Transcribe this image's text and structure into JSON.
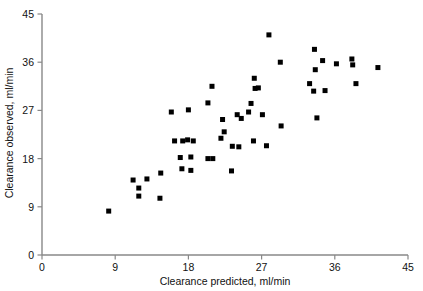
{
  "chart_data": {
    "type": "scatter",
    "title": "",
    "xlabel": "Clearance predicted, ml/min",
    "ylabel": "Clearance observed, ml/min",
    "xlim": [
      0,
      45
    ],
    "ylim": [
      0,
      45
    ],
    "xticks": [
      0,
      9,
      18,
      27,
      36,
      45
    ],
    "yticks": [
      0,
      9,
      18,
      27,
      36,
      45
    ],
    "xticklabels": [
      "0",
      "9",
      "18",
      "27",
      "36",
      "45"
    ],
    "yticklabels": [
      "0",
      "9",
      "18",
      "27",
      "36",
      "45"
    ],
    "grid": false,
    "legend": null,
    "marker": "square",
    "marker_color": "#000000",
    "marker_size_px": 5,
    "axis_color": "#888888",
    "series": [
      {
        "name": "patients",
        "points": [
          [
            8.2,
            8.2
          ],
          [
            11.2,
            14.0
          ],
          [
            11.9,
            12.5
          ],
          [
            12.9,
            14.2
          ],
          [
            11.9,
            11.0
          ],
          [
            14.6,
            15.3
          ],
          [
            14.5,
            10.6
          ],
          [
            15.9,
            26.7
          ],
          [
            16.3,
            21.3
          ],
          [
            17.3,
            21.3
          ],
          [
            17.0,
            18.2
          ],
          [
            17.2,
            16.1
          ],
          [
            18.0,
            27.1
          ],
          [
            17.9,
            21.5
          ],
          [
            18.6,
            21.3
          ],
          [
            18.3,
            18.3
          ],
          [
            18.3,
            15.8
          ],
          [
            20.4,
            18.0
          ],
          [
            21.0,
            18.0
          ],
          [
            20.4,
            28.4
          ],
          [
            20.9,
            31.5
          ],
          [
            22.2,
            25.3
          ],
          [
            22.4,
            23.0
          ],
          [
            22.0,
            21.8
          ],
          [
            23.4,
            20.3
          ],
          [
            23.3,
            15.7
          ],
          [
            24.0,
            26.2
          ],
          [
            24.5,
            25.5
          ],
          [
            24.2,
            20.2
          ],
          [
            25.4,
            26.7
          ],
          [
            25.7,
            28.3
          ],
          [
            26.2,
            31.1
          ],
          [
            26.6,
            31.2
          ],
          [
            26.1,
            33.0
          ],
          [
            26.0,
            21.3
          ],
          [
            27.9,
            41.1
          ],
          [
            27.1,
            26.2
          ],
          [
            27.6,
            20.4
          ],
          [
            29.3,
            36.0
          ],
          [
            29.4,
            24.1
          ],
          [
            32.9,
            32.0
          ],
          [
            33.5,
            38.4
          ],
          [
            33.6,
            34.6
          ],
          [
            33.4,
            30.6
          ],
          [
            34.5,
            36.3
          ],
          [
            33.8,
            25.6
          ],
          [
            34.8,
            30.7
          ],
          [
            36.2,
            35.7
          ],
          [
            38.1,
            36.6
          ],
          [
            38.2,
            35.5
          ],
          [
            38.6,
            32.0
          ],
          [
            41.3,
            35.0
          ]
        ]
      }
    ]
  },
  "axes": {
    "x_axis_name": "x-axis",
    "y_axis_name": "y-axis"
  }
}
